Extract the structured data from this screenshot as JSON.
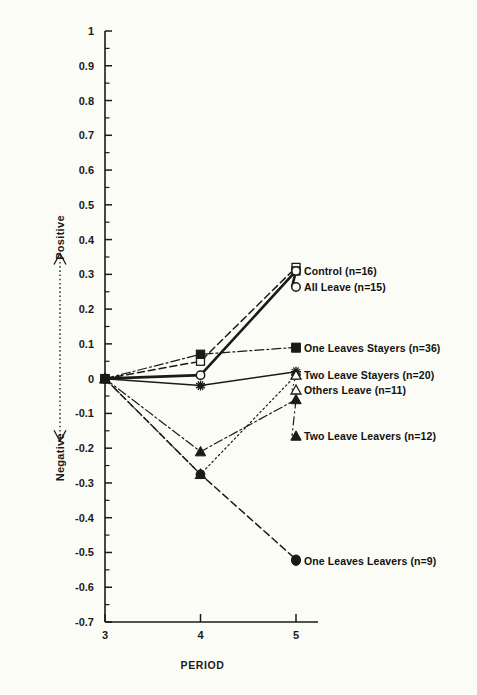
{
  "chart_data": {
    "type": "line",
    "title": "",
    "xlabel": "PERIOD",
    "ylabel": "",
    "x": [
      3,
      4,
      5
    ],
    "xtick_labels": [
      "3",
      "4",
      "5"
    ],
    "xlim": [
      2.72,
      5.28
    ],
    "ylim": [
      -0.7,
      1
    ],
    "ytick_labels": [
      "1",
      "0.9",
      "0.8",
      "0.7",
      "0.6",
      "0.5",
      "0.4",
      "0.3",
      "0.2",
      "0.1",
      "0",
      "-0.1",
      "-0.2",
      "-0.3",
      "-0.4",
      "-0.5",
      "-0.6",
      "-0.7"
    ],
    "ytick_values": [
      1,
      0.9,
      0.8,
      0.7,
      0.6,
      0.5,
      0.4,
      0.3,
      0.2,
      0.1,
      0,
      -0.1,
      -0.2,
      -0.3,
      -0.4,
      -0.5,
      -0.6,
      -0.7
    ],
    "yminor_values": [
      0.95,
      0.85,
      0.75,
      0.65,
      0.55,
      0.45,
      0.35,
      0.25,
      0.15,
      0.05,
      -0.05,
      -0.15,
      -0.25,
      -0.35,
      -0.45,
      -0.55,
      -0.65
    ],
    "grid": false,
    "legend_position": "inline-right-of-endpoints",
    "direction_axis": {
      "positive_label": "Positive",
      "negative_label": "Negative"
    },
    "series": [
      {
        "name": "Control (n=16)",
        "values": [
          0,
          0.05,
          0.32
        ],
        "marker": "open-square",
        "line": "dashed",
        "color": "#1a1a1a",
        "label_x": 304,
        "label_y": 275
      },
      {
        "name": "All Leave (n=15)",
        "values": [
          0,
          0.01,
          0.31
        ],
        "marker": "open-circle",
        "line": "solid-thick",
        "color": "#1a1a1a",
        "label_x": 304,
        "label_y": 291
      },
      {
        "name": "One Leaves Stayers (n=36)",
        "values": [
          0,
          0.07,
          0.09
        ],
        "marker": "filled-square",
        "line": "dash-dot",
        "color": "#1a1a1a",
        "label_x": 304,
        "label_y": 352
      },
      {
        "name": "Two Leave Stayers (n=20)",
        "values": [
          0,
          -0.02,
          0.02
        ],
        "marker": "star",
        "line": "solid",
        "color": "#1a1a1a",
        "label_x": 304,
        "label_y": 379
      },
      {
        "name": "Others Leave (n=11)",
        "values": [
          0,
          -0.275,
          0.01
        ],
        "marker": "open-triangle",
        "line": "dotted",
        "color": "#1a1a1a",
        "label_x": 304,
        "label_y": 394
      },
      {
        "name": "Two Leave Leavers (n=12)",
        "values": [
          0,
          -0.21,
          -0.06
        ],
        "marker": "filled-triangle",
        "line": "dash-dot",
        "color": "#1a1a1a",
        "label_x": 304,
        "label_y": 440
      },
      {
        "name": "One Leaves Leavers (n=9)",
        "values": [
          0,
          -0.275,
          -0.52
        ],
        "marker": "filled-circle",
        "line": "dashed",
        "color": "#1a1a1a",
        "label_x": 304,
        "label_y": 565
      }
    ]
  },
  "colors": {
    "background": "#fcfcf7",
    "ink": "#1a1a1a"
  }
}
